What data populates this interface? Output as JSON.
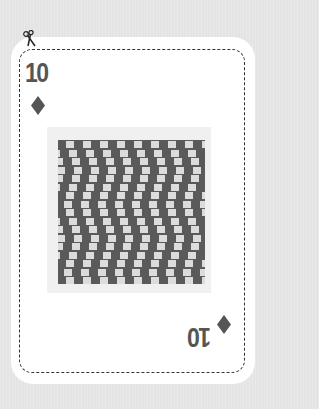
{
  "card": {
    "rank": "10",
    "suit": "diamonds",
    "suit_icon": "diamond-icon",
    "cut_icon": "scissors-icon",
    "colors": {
      "background": "#e4e4e4",
      "card": "#ffffff",
      "ink": "#555555",
      "pattern_dark": "#5a5a5a",
      "pattern_light": "#dcdcdc",
      "art_frame": "#f0f0f0"
    },
    "artwork": {
      "name": "cafe-wall-illusion",
      "rows": 17,
      "row_offsets_px": [
        0,
        3,
        6,
        8,
        6,
        3,
        0,
        -2,
        0,
        3,
        6,
        8,
        6,
        3,
        0,
        -2,
        0
      ]
    }
  }
}
